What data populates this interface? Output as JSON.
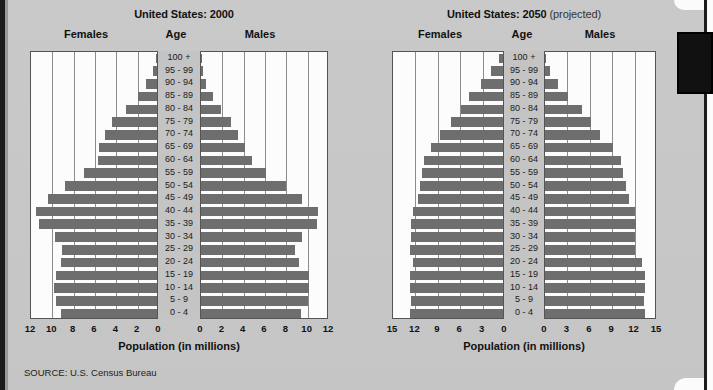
{
  "source_note": "SOURCE: U.S. Census Bureau",
  "panels": [
    {
      "title_main": "United States: 2000",
      "title_suffix": "",
      "females_label": "Females",
      "age_label": "Age",
      "males_label": "Males",
      "axis_title": "Population (in millions)"
    },
    {
      "title_main": "United States: 2050",
      "title_suffix": " (projected)",
      "females_label": "Females",
      "age_label": "Age",
      "males_label": "Males",
      "axis_title": "Population (in millions)"
    }
  ],
  "chart_data": [
    {
      "type": "bar",
      "title": "United States: 2000",
      "subtitle": "",
      "xlabel": "Population (in millions)",
      "ylabel": "Age",
      "orientation": "horizontal-pyramid",
      "grid": true,
      "legend_position": "none",
      "xlim": [
        0,
        12
      ],
      "xticks": [
        12,
        10,
        8,
        6,
        4,
        2,
        0,
        0,
        2,
        4,
        6,
        8,
        10,
        12
      ],
      "xticks_half": [
        0,
        2,
        4,
        6,
        8,
        10,
        12
      ],
      "categories": [
        "100 +",
        "95 - 99",
        "90 - 94",
        "85 - 89",
        "80 - 84",
        "75 - 79",
        "70 - 74",
        "65 - 69",
        "60 - 64",
        "55 - 59",
        "50 - 54",
        "45 - 49",
        "40 - 44",
        "35 - 39",
        "30 - 34",
        "25 - 29",
        "20 - 24",
        "15 - 19",
        "10 - 14",
        "5 - 9",
        "0 - 4"
      ],
      "series": [
        {
          "name": "Females",
          "side": "left",
          "values": [
            0.05,
            0.4,
            1.0,
            1.8,
            2.9,
            4.2,
            4.9,
            5.4,
            5.5,
            6.8,
            8.6,
            10.2,
            11.3,
            11.1,
            9.6,
            8.9,
            9.0,
            9.5,
            9.7,
            9.5,
            9.0
          ]
        },
        {
          "name": "Males",
          "side": "right",
          "values": [
            0.02,
            0.15,
            0.5,
            1.1,
            1.9,
            2.8,
            3.5,
            4.1,
            4.8,
            6.1,
            8.0,
            9.5,
            11.0,
            10.9,
            9.5,
            8.8,
            9.2,
            10.1,
            10.1,
            10.0,
            9.4
          ]
        }
      ]
    },
    {
      "type": "bar",
      "title": "United States: 2050 (projected)",
      "subtitle": "projected",
      "xlabel": "Population (in millions)",
      "ylabel": "Age",
      "orientation": "horizontal-pyramid",
      "grid": true,
      "legend_position": "none",
      "xlim": [
        0,
        15
      ],
      "xticks": [
        15,
        12,
        9,
        6,
        3,
        0,
        0,
        3,
        6,
        9,
        12,
        15
      ],
      "xticks_half": [
        0,
        3,
        6,
        9,
        12,
        15
      ],
      "categories": [
        "100 +",
        "95 - 99",
        "90 - 94",
        "85 - 89",
        "80 - 84",
        "75 - 79",
        "70 - 74",
        "65 - 69",
        "60 - 64",
        "55 - 59",
        "50 - 54",
        "45 - 49",
        "40 - 44",
        "35 - 39",
        "30 - 34",
        "25 - 29",
        "20 - 24",
        "15 - 19",
        "10 - 14",
        "5 - 9",
        "0 - 4"
      ],
      "series": [
        {
          "name": "Females",
          "side": "left",
          "values": [
            0.6,
            1.6,
            2.9,
            4.5,
            5.6,
            6.9,
            8.4,
            9.6,
            10.6,
            10.9,
            11.1,
            11.4,
            12.1,
            12.3,
            12.3,
            12.4,
            12.0,
            12.4,
            12.4,
            12.3,
            12.4
          ]
        },
        {
          "name": "Males",
          "side": "right",
          "values": [
            0.2,
            0.7,
            1.8,
            3.1,
            4.9,
            6.1,
            7.4,
            9.1,
            10.2,
            10.5,
            10.8,
            11.3,
            12.0,
            12.2,
            12.1,
            12.1,
            13.0,
            13.4,
            13.4,
            13.2,
            13.4
          ]
        }
      ]
    }
  ]
}
